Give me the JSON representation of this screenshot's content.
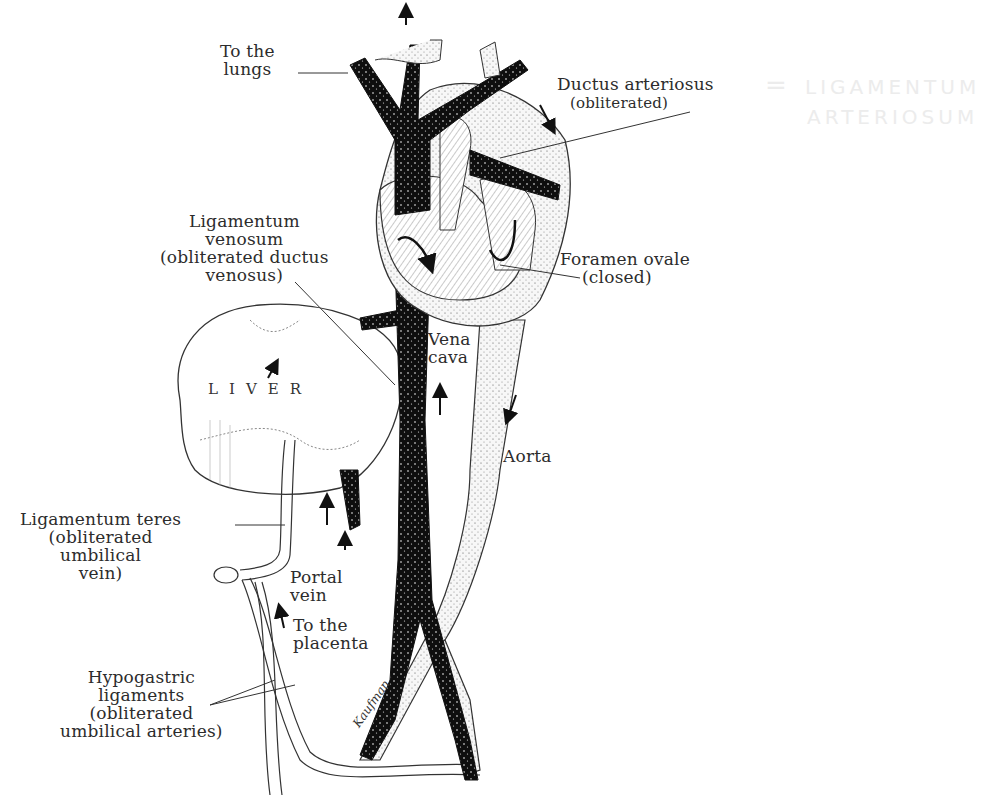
{
  "diagram": {
    "labels": {
      "to_lungs": "To the\nlungs",
      "ductus_arteriosus": "Ductus arteriosus",
      "ductus_arteriosus_note": "(obliterated)",
      "handwritten_equals": "=",
      "handwritten_note": "LIGAMENTUM\nARTERIOSUM",
      "ligamentum_venosum": "Ligamentum\nvenosum\n(obliterated ductus\nvenosus)",
      "foramen_ovale": "Foramen ovale",
      "foramen_ovale_note": "(closed)",
      "vena_cava": "Vena\ncava",
      "liver": "LIVER",
      "aorta": "Aorta",
      "ligamentum_teres": "Ligamentum teres\n(obliterated\numbilical\nvein)",
      "portal_vein": "Portal\nvein",
      "to_placenta": "To the\nplacenta",
      "hypogastric": "Hypogastric\nligaments\n(obliterated\numbilical arteries)",
      "signature": "Kaufman"
    },
    "colors": {
      "ink": "#1a1a1a",
      "venous_fill": "#111111",
      "arterial_fill": "#f4f4f4",
      "paper": "#ffffff",
      "faint_pencil": "#ececec"
    }
  }
}
